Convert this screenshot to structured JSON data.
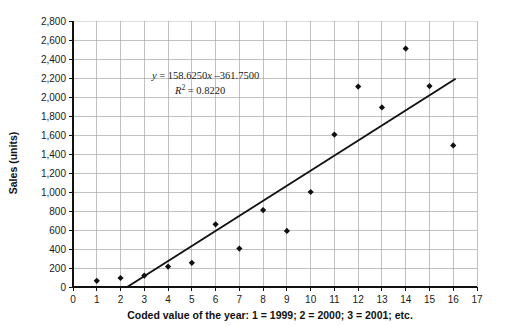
{
  "chart_data": {
    "type": "scatter",
    "title": "",
    "xlabel": "Coded value of the year: 1 = 1999; 2 = 2000;  3 = 2001; etc.",
    "ylabel": "Sales (units)",
    "xlim": [
      0,
      17
    ],
    "ylim": [
      0,
      2800
    ],
    "xticks": [
      0,
      1,
      2,
      3,
      4,
      5,
      6,
      7,
      8,
      9,
      10,
      11,
      12,
      13,
      14,
      15,
      16,
      17
    ],
    "xtick_labels": [
      "0",
      "1",
      "2",
      "3",
      "4",
      "5",
      "6",
      "7",
      "8",
      "9",
      "10",
      "11",
      "12",
      "13",
      "14",
      "15",
      "16",
      "17"
    ],
    "yticks": [
      0,
      200,
      400,
      600,
      800,
      1000,
      1200,
      1400,
      1600,
      1800,
      2000,
      2200,
      2400,
      2600,
      2800
    ],
    "ytick_labels": [
      "0",
      "200",
      "400",
      "600",
      "800",
      "1,000",
      "1,200",
      "1,400",
      "1,600",
      "1,800",
      "2,000",
      "2,200",
      "2,400",
      "2,600",
      "2,800"
    ],
    "grid": true,
    "legend": false,
    "marker": "diamond",
    "series": [
      {
        "name": "Sales",
        "x": [
          1,
          2,
          3,
          4,
          5,
          6,
          7,
          8,
          9,
          10,
          11,
          12,
          13,
          14,
          15,
          16
        ],
        "values": [
          65,
          95,
          120,
          215,
          255,
          660,
          405,
          810,
          590,
          1000,
          1605,
          2110,
          1890,
          2510,
          2115,
          1490
        ]
      }
    ],
    "trendline": {
      "slope": 158.625,
      "intercept": -361.75,
      "x_start": 2.28,
      "x_end": 16.1,
      "equation_label": "y = 158.6250x –361.7500",
      "r_squared_label": "R² = 0.8220",
      "r_squared_value": 0.822
    },
    "annotations": [
      {
        "text": "y = 158.6250x –361.7500",
        "x": 7.0,
        "y": 2230
      },
      {
        "text": "R² = 0.8220",
        "x": 7.0,
        "y": 2070
      }
    ],
    "colors": {
      "marker": "#101010",
      "trendline": "#111111",
      "gridline": "#9a9a9a",
      "axis": "#111111",
      "background": "#ffffff"
    }
  },
  "equation": {
    "lhs": "y",
    "equals": "=",
    "rhs": "158.6250x –361.7500",
    "r_symbol": "R",
    "r_exponent": "2",
    "r_equals": "=",
    "r_value": "0.8220"
  }
}
